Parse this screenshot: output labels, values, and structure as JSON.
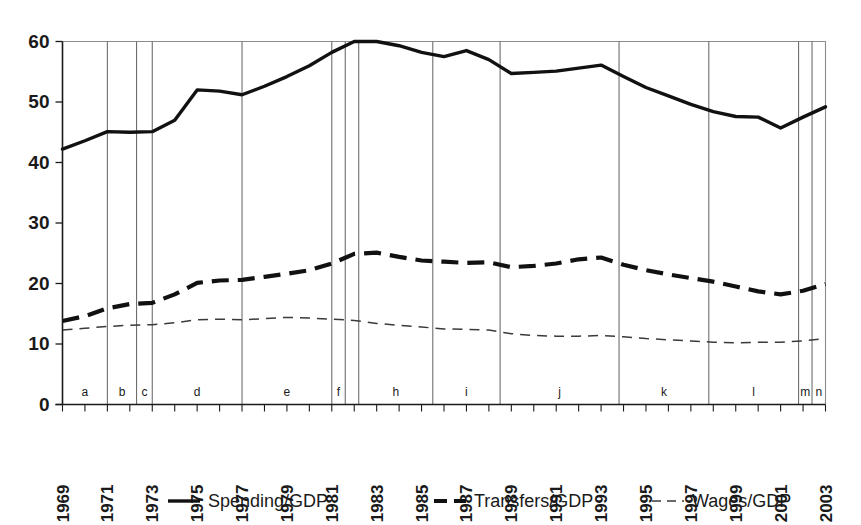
{
  "chart_data": {
    "type": "line",
    "title": "",
    "subtitle": "",
    "xlabel": "",
    "ylabel": "",
    "xlim": [
      1969,
      2003
    ],
    "ylim": [
      0,
      60
    ],
    "grid": false,
    "legend_position": "bottom",
    "y_ticks": [
      "0",
      "10",
      "20",
      "30",
      "40",
      "50",
      "60"
    ],
    "y_tick_values": [
      0,
      10,
      20,
      30,
      40,
      50,
      60
    ],
    "x_tick_labels": [
      "1969",
      "1971",
      "1973",
      "1975",
      "1977",
      "1979",
      "1981",
      "1983",
      "1985",
      "1987",
      "1989",
      "1991",
      "1993",
      "1995",
      "1997",
      "1999",
      "2001",
      "2003"
    ],
    "x_tick_values": [
      1969,
      1971,
      1973,
      1975,
      1977,
      1979,
      1981,
      1983,
      1985,
      1987,
      1989,
      1991,
      1993,
      1995,
      1997,
      1999,
      2001,
      2003
    ],
    "x": [
      1969,
      1970,
      1971,
      1972,
      1973,
      1974,
      1975,
      1976,
      1977,
      1978,
      1979,
      1980,
      1981,
      1982,
      1983,
      1984,
      1985,
      1986,
      1987,
      1988,
      1989,
      1990,
      1991,
      1992,
      1993,
      1994,
      1995,
      1996,
      1997,
      1998,
      1999,
      2000,
      2001,
      2002,
      2003
    ],
    "series": [
      {
        "name": "Spending/GDP",
        "style": "solid-thick",
        "values": [
          42.2,
          43.6,
          45.1,
          45.0,
          45.1,
          47.0,
          52.0,
          51.8,
          51.2,
          52.6,
          54.2,
          56.0,
          58.2,
          60.0,
          60.0,
          59.3,
          58.2,
          57.5,
          58.5,
          57.0,
          54.7,
          54.9,
          55.1,
          55.6,
          56.1,
          54.2,
          52.4,
          51.0,
          49.6,
          48.4,
          47.6,
          47.5,
          45.7,
          47.5,
          49.2
        ]
      },
      {
        "name": "Transfers/GDP",
        "style": "dashed-thick",
        "values": [
          13.8,
          14.6,
          15.9,
          16.6,
          16.8,
          18.2,
          20.1,
          20.5,
          20.6,
          21.1,
          21.6,
          22.2,
          23.3,
          24.9,
          25.1,
          24.4,
          23.8,
          23.6,
          23.4,
          23.5,
          22.7,
          22.9,
          23.3,
          24.0,
          24.3,
          23.1,
          22.2,
          21.5,
          20.9,
          20.3,
          19.5,
          18.7,
          18.2,
          18.8,
          19.9
        ]
      },
      {
        "name": "Wages/GDP",
        "style": "dashed-thin",
        "values": [
          12.3,
          12.6,
          12.9,
          13.1,
          13.2,
          13.5,
          14.0,
          14.1,
          14.0,
          14.2,
          14.4,
          14.3,
          14.1,
          13.9,
          13.4,
          13.1,
          12.8,
          12.5,
          12.4,
          12.3,
          11.7,
          11.4,
          11.3,
          11.3,
          11.4,
          11.2,
          10.9,
          10.7,
          10.5,
          10.3,
          10.2,
          10.3,
          10.3,
          10.5,
          10.9
        ]
      }
    ],
    "region_dividers": [
      1971.0,
      1972.3,
      1973.0,
      1977.0,
      1981.0,
      1981.6,
      1982.2,
      1985.5,
      1988.5,
      1993.8,
      1997.8,
      2001.8,
      2002.4
    ],
    "region_labels": [
      {
        "label": "a",
        "start": 1969.0,
        "end": 1971.0
      },
      {
        "label": "b",
        "start": 1971.0,
        "end": 1972.3
      },
      {
        "label": "c",
        "start": 1972.3,
        "end": 1973.0
      },
      {
        "label": "d",
        "start": 1973.0,
        "end": 1977.0
      },
      {
        "label": "e",
        "start": 1977.0,
        "end": 1981.0
      },
      {
        "label": "f",
        "start": 1981.0,
        "end": 1981.6
      },
      {
        "label": "",
        "start": 1981.6,
        "end": 1982.2
      },
      {
        "label": "h",
        "start": 1982.2,
        "end": 1985.5
      },
      {
        "label": "i",
        "start": 1985.5,
        "end": 1988.5
      },
      {
        "label": "j",
        "start": 1988.5,
        "end": 1993.8
      },
      {
        "label": "k",
        "start": 1993.8,
        "end": 1997.8
      },
      {
        "label": "l",
        "start": 1997.8,
        "end": 2001.8
      },
      {
        "label": "m",
        "start": 2001.8,
        "end": 2002.4
      },
      {
        "label": "n",
        "start": 2002.4,
        "end": 2003.0
      }
    ],
    "legend": [
      {
        "label": "Spending/GDP",
        "style": "solid-thick"
      },
      {
        "label": "Transfers/GDP",
        "style": "dashed-thick"
      },
      {
        "label": "Wages/GDP",
        "style": "dashed-thin"
      }
    ],
    "colors": {
      "series": "#111111",
      "wages": "#3a3a3a",
      "axis": "#1a1a1a",
      "divider": "#6e6e6e",
      "background": "#ffffff"
    }
  }
}
